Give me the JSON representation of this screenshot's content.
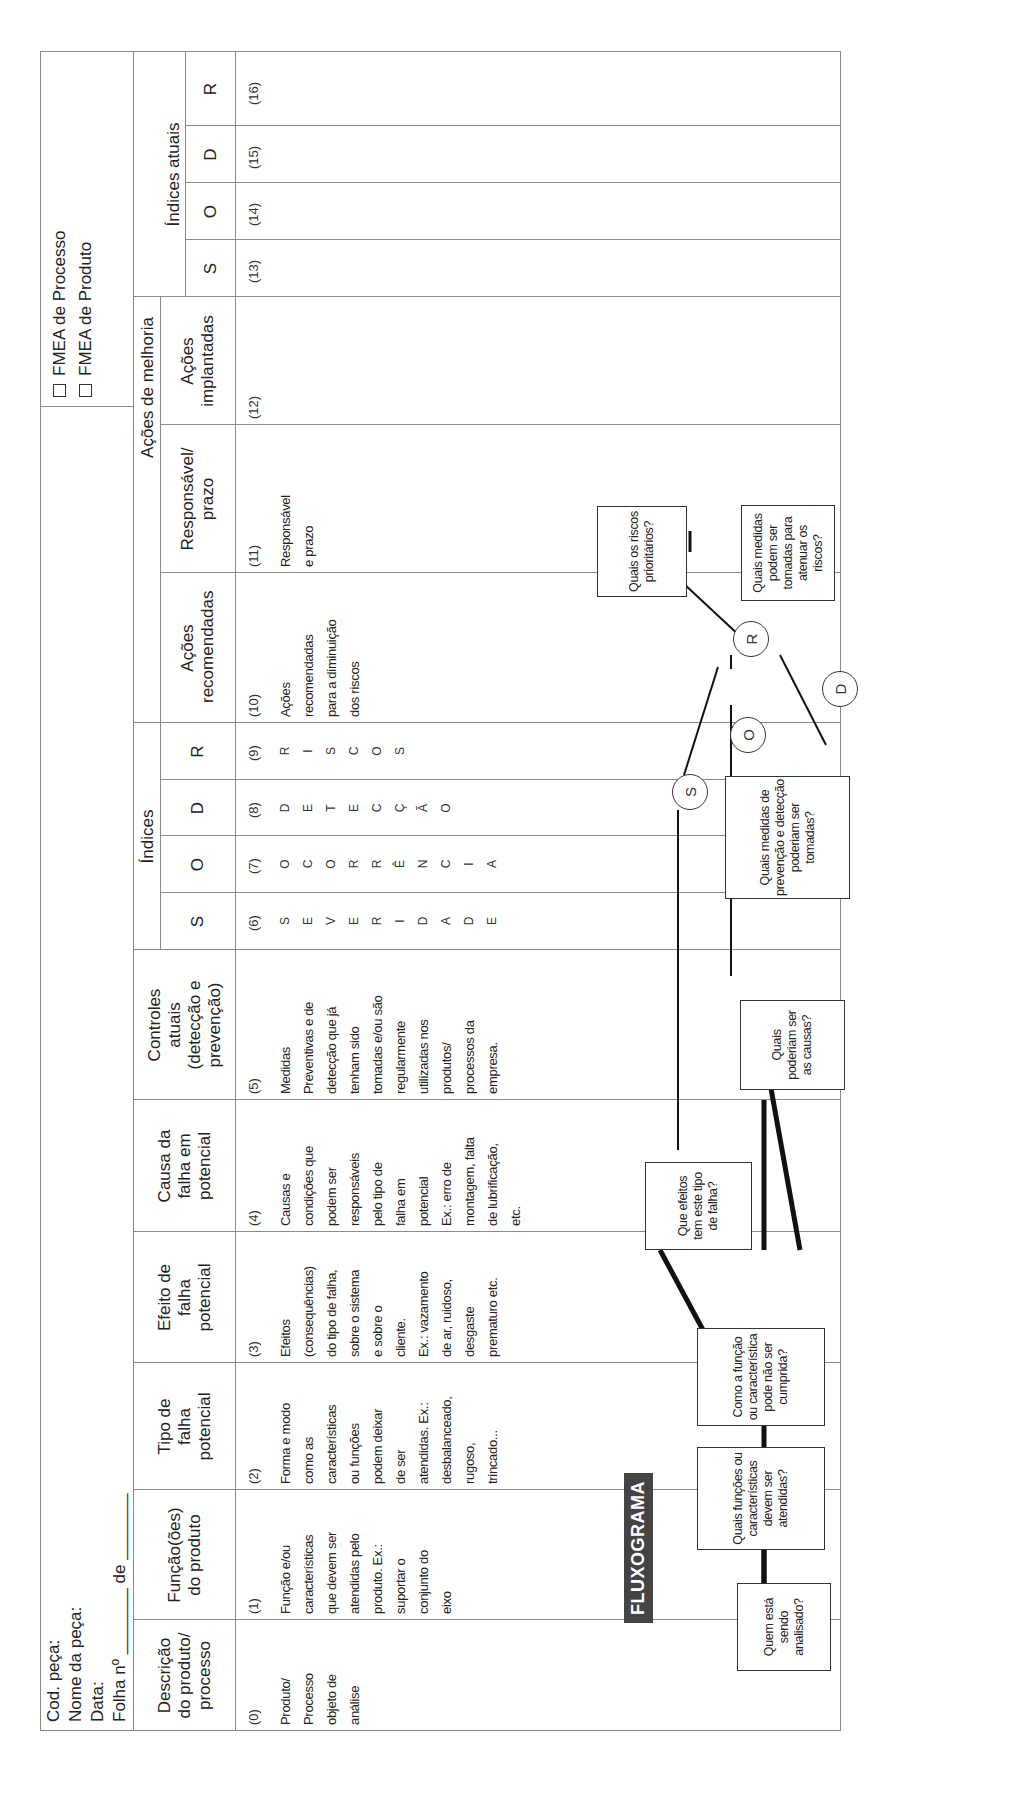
{
  "header": {
    "cod_peca": "Cod. peça:",
    "nome_peca": "Nome da peça:",
    "data": "Data:",
    "folha": "Folha nº _______ de _______",
    "checkbox_processo": "FMEA de Processo",
    "checkbox_produto": "FMEA de Produto"
  },
  "groups": {
    "indices": "Índices",
    "acoes_melhoria": "Ações de melhoria",
    "indices_atuais": "Índices atuais"
  },
  "columns": [
    {
      "label": "Descrição do produto/ processo",
      "num": "(0)",
      "body": "Produto/ Processo objeto de análise"
    },
    {
      "label": "Função(ões) do produto",
      "num": "(1)",
      "body": "Função e/ou características que devem ser atendidas pelo produto. Ex.: suportar o conjunto do eixo"
    },
    {
      "label": "Tipo de falha potencial",
      "num": "(2)",
      "body": "Forma e modo como as características ou funções podem deixar de ser atendidas. Ex.: desbalanceado, rugoso, trincado..."
    },
    {
      "label": "Efeito de falha potencial",
      "num": "(3)",
      "body": "Efeitos (consequências) do tipo de falha, sobre o sistema e sobre o cliente. Ex.: vazamento de ar, ruidoso, desgaste prematuro etc."
    },
    {
      "label": "Causa da falha em potencial",
      "num": "(4)",
      "body": "Causas e condições que podem ser responsáveis pelo tipo de falha em potencial Ex.: erro de montagem, falta de lubrificação, etc."
    },
    {
      "label": "Controles atuais (detecção e prevenção)",
      "num": "(5)",
      "body": "Medidas Preventivas e de detecção que já tenham sido tomadas e/ou são regularmente utilizadas nos produtos/ processos da empresa."
    },
    {
      "label": "S",
      "num": "(6)",
      "letters": [
        "S",
        "E",
        "V",
        "E",
        "R",
        "I",
        "D",
        "A",
        "D",
        "E"
      ]
    },
    {
      "label": "O",
      "num": "(7)",
      "letters": [
        "O",
        "C",
        "O",
        "R",
        "R",
        "Ê",
        "N",
        "C",
        "I",
        "A"
      ]
    },
    {
      "label": "D",
      "num": "(8)",
      "letters": [
        "D",
        "E",
        "T",
        "E",
        "C",
        "Ç",
        "Ã",
        "O"
      ]
    },
    {
      "label": "R",
      "num": "(9)",
      "letters": [
        "R",
        "I",
        "S",
        "C",
        "O",
        "S"
      ]
    },
    {
      "label": "Ações recomendadas",
      "num": "(10)",
      "body": "Ações recomendadas para a diminuição dos riscos"
    },
    {
      "label": "Responsável/ prazo",
      "num": "(11)",
      "body": "Responsável e prazo"
    },
    {
      "label": "Ações implantadas",
      "num": "(12)",
      "body": ""
    },
    {
      "label": "S",
      "num": "(13)"
    },
    {
      "label": "O",
      "num": "(14)"
    },
    {
      "label": "D",
      "num": "(15)"
    },
    {
      "label": "R",
      "num": "(16)"
    }
  ],
  "body_lines": {
    "c0": [
      "Produto/",
      "Processo",
      "objeto de",
      "análise"
    ],
    "c1": [
      "Função e/ou",
      "características",
      "que devem ser",
      "atendidas pelo",
      "produto. Ex.:",
      "suportar o",
      "conjunto do",
      "eixo"
    ],
    "c2": [
      "Forma e modo",
      "como as",
      "características",
      "ou funções",
      "podem deixar",
      "de ser",
      "atendidas. Ex.:",
      "desbalanceado,",
      "rugoso,",
      "trincado..."
    ],
    "c3": [
      "Efeitos",
      "(consequências)",
      "do tipo de falha,",
      "sobre o sistema",
      "e sobre o",
      "cliente.",
      "Ex.: vazamento",
      "de ar, ruidoso,",
      "desgaste",
      "prematuro etc."
    ],
    "c4": [
      "Causas e",
      "condições que",
      "podem ser",
      "responsáveis",
      "pelo tipo de",
      "falha em",
      "potencial",
      "Ex.: erro de",
      "montagem, falta",
      "de lubrificação,",
      "etc."
    ],
    "c5": [
      "Medidas",
      "Preventivas e de",
      "detecção que já",
      "tenham sido",
      "tomadas e/ou são",
      "regularmente",
      "utilizadas nos",
      "produtos/",
      "processos da",
      "empresa."
    ],
    "c10": [
      "Ações",
      "recomendadas",
      "para a diminuição",
      "dos riscos"
    ],
    "c11": [
      "Responsável",
      "e prazo"
    ]
  },
  "flowchart": {
    "title": "FLUXOGRAMA",
    "boxes": {
      "quem": "Quem está sendo analisado?",
      "funcoes": "Quais funções ou características devem ser atendidas?",
      "como": "Como a função ou característica pode não ser cumprida?",
      "efeitos": "Que efeitos tem este tipo de falha?",
      "causas": "Quais poderiam ser as causas?",
      "medidas_prev": "Quais medidas de prevenção e detecção poderiam ser tomadas?",
      "riscos": "Quais os riscos prioritários?",
      "atenuar": "Quais medidas podem ser tomadas para atenuar os riscos?"
    },
    "nodes": {
      "s": "S",
      "o": "O",
      "d": "D",
      "r": "R"
    }
  }
}
